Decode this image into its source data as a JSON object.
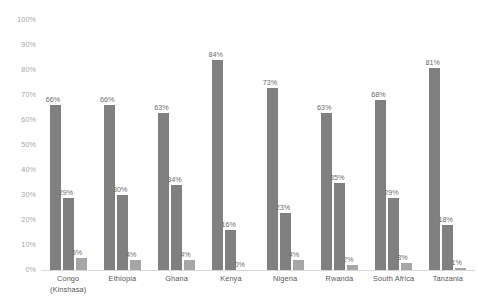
{
  "chart_data": {
    "type": "bar",
    "title": "",
    "subtitle": "",
    "xlabel": "",
    "ylabel": "",
    "ylim": [
      0,
      100
    ],
    "y_tick_labels": [
      "100%",
      "90%",
      "80%",
      "70%",
      "60%",
      "50%",
      "40%",
      "30%",
      "20%",
      "10%",
      "0%"
    ],
    "y_tick_values": [
      100,
      90,
      80,
      70,
      60,
      50,
      40,
      30,
      20,
      10,
      0
    ],
    "grid": false,
    "legend": "none",
    "value_suffix": "%",
    "categories": [
      "Congo (Kinshasa)",
      "Ethiopia",
      "Ghana",
      "Kenya",
      "Nigeria",
      "Rwanda",
      "South Africa",
      "Tanzania"
    ],
    "category_lines": [
      [
        "Congo",
        "(Kinshasa)"
      ],
      [
        "Ethiopia"
      ],
      [
        "Ghana"
      ],
      [
        "Kenya"
      ],
      [
        "Nigeria"
      ],
      [
        "Rwanda"
      ],
      [
        "South Africa"
      ],
      [
        "Tanzania"
      ]
    ],
    "series": [
      {
        "name": "Series 1",
        "color": "#808080",
        "values": [
          66,
          66,
          63,
          84,
          73,
          63,
          68,
          81
        ],
        "labels": [
          "66%",
          "66%",
          "63%",
          "84%",
          "73%",
          "63%",
          "68%",
          "81%"
        ]
      },
      {
        "name": "Series 2",
        "color": "#808080",
        "values": [
          29,
          30,
          34,
          16,
          23,
          35,
          29,
          18
        ],
        "labels": [
          "29%",
          "30%",
          "34%",
          "16%",
          "23%",
          "35%",
          "29%",
          "18%"
        ]
      },
      {
        "name": "Series 3",
        "color": "#a6a6a6",
        "values": [
          5,
          4,
          4,
          0,
          4,
          2,
          3,
          1
        ],
        "labels": [
          "5%",
          "4%",
          "4%",
          "0%",
          "4%",
          "2%",
          "3%",
          "1%"
        ]
      }
    ]
  },
  "colors": {
    "series_primary": "#808080",
    "series_light": "#a6a6a6",
    "axis_text": "#a9a9a9",
    "category_text": "#595959",
    "data_label_text": "#6b6b6b",
    "baseline": "#d9d9d9",
    "background": "#ffffff"
  }
}
